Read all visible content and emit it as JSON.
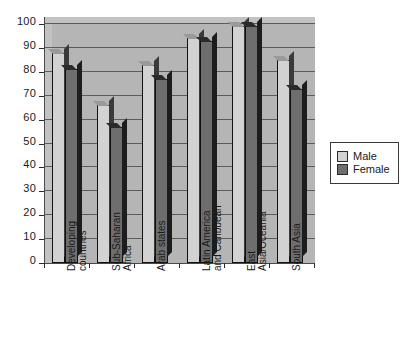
{
  "chart_data": {
    "type": "bar",
    "title": "",
    "subtitle": "",
    "xlabel": "",
    "ylabel": "",
    "ylim": [
      0,
      100
    ],
    "ytick_step": 10,
    "yticks": [
      100,
      90,
      80,
      70,
      60,
      50,
      40,
      30,
      20,
      10,
      0
    ],
    "grid": true,
    "legend_position": "right",
    "categories": [
      "Developing countries",
      "Sub-Saharan Africa",
      "Arab states",
      "Latin America and Caribbean",
      "East Asia/Oceania",
      "South Asia"
    ],
    "category_lines": [
      [
        "Developing",
        "countries"
      ],
      [
        "Sub-Saharan",
        "Africa"
      ],
      [
        "Arab states",
        ""
      ],
      [
        "Latin America",
        "and Caribbean"
      ],
      [
        "East",
        "Asia/Oceania"
      ],
      [
        "South Asia",
        ""
      ]
    ],
    "series": [
      {
        "name": "Male",
        "color": "#d2d2d2",
        "values": [
          88,
          66,
          83,
          94,
          99,
          85
        ]
      },
      {
        "name": "Female",
        "color": "#6e6e6e",
        "values": [
          81,
          57,
          77,
          93,
          99,
          73
        ]
      }
    ]
  },
  "legend": {
    "items": [
      {
        "label": "Male",
        "color": "#d2d2d2"
      },
      {
        "label": "Female",
        "color": "#6e6e6e"
      }
    ]
  },
  "colors": {
    "plot_background": "#b5b5b5",
    "gridline": "#5c5c5c",
    "axis": "#2a2a2a",
    "male_bar": "#d2d2d2",
    "female_bar": "#6e6e6e",
    "page_background": "#ffffff"
  }
}
